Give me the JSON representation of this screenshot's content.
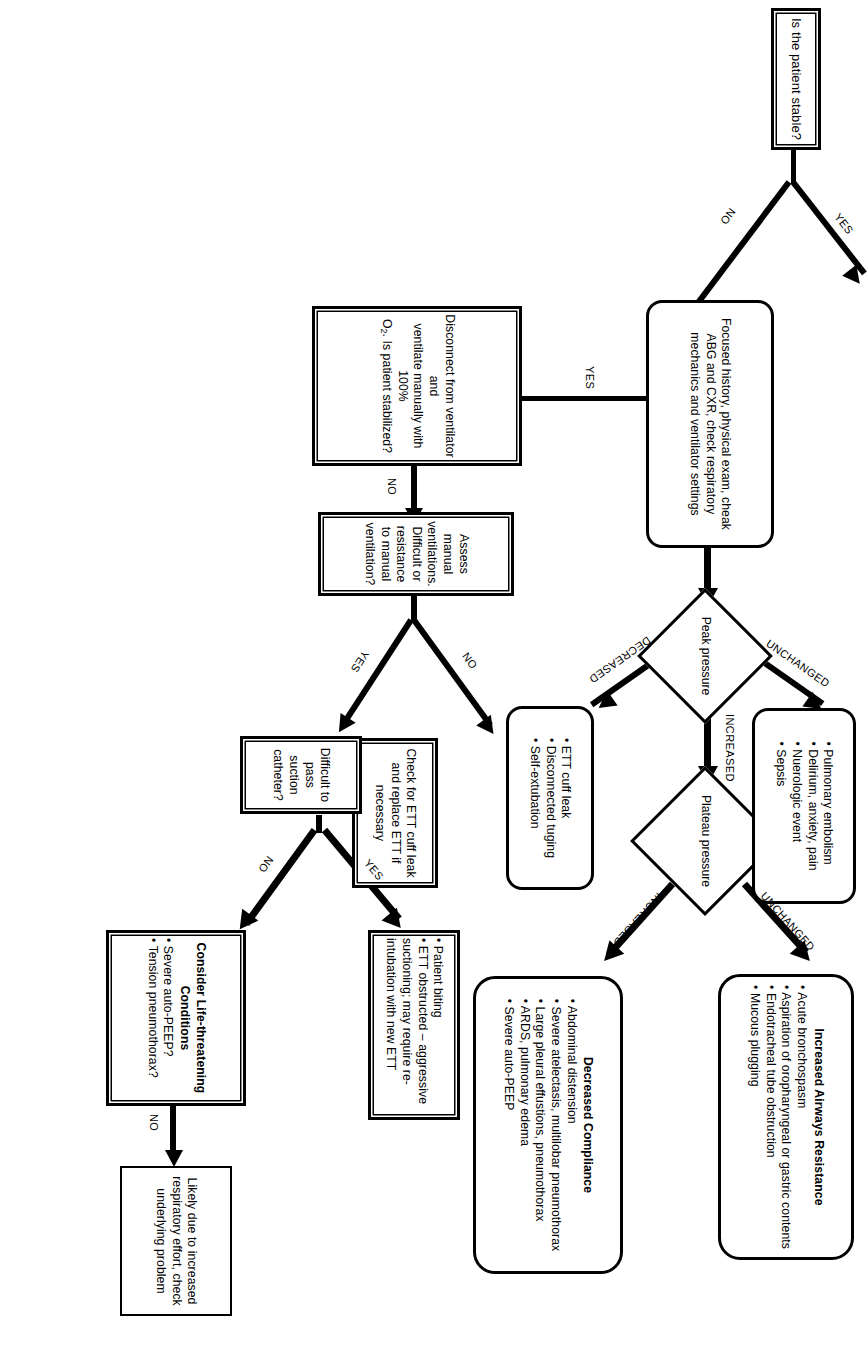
{
  "diagram": {
    "type": "flowchart",
    "orientation": "rotated-90-clockwise",
    "nodes": {
      "start": {
        "text": "Is the patient stable?"
      },
      "focused_history": {
        "text": "Focused history, physical exam, cheak ABG and CXR, check respiratory mechanics and ventilator settings"
      },
      "peak_pressure": {
        "text": "Peak pressure"
      },
      "plateau_pressure": {
        "text": "Plateau pressure"
      },
      "unchanged_list": {
        "items": [
          "Pulmonary embolism",
          "Delirium, anxiety, pain",
          "Nuerologic event",
          "Sepsis"
        ]
      },
      "decreased_list": {
        "items": [
          "ETT cuff leak",
          "Disconnected tuging",
          "Self-extubation"
        ]
      },
      "increased_airways_resistance": {
        "heading": "Increased Airways Resistance",
        "items": [
          "Acute bronchospasm",
          "Aspiration of oropharyngeal or gastric contents",
          "Endotracheal tube obstruction",
          "Mucous plugging"
        ]
      },
      "decreased_compliance": {
        "heading": "Decreased Compliance",
        "items": [
          "Abdominal distension",
          "Severe atelectasis, multilobar pneumothorax",
          "Large pleural effustions, pneumothorax",
          "ARDS, pulmonary edema",
          "Severe auto-PEEP"
        ]
      },
      "disconnect": {
        "line1": "Disconnect from ventilator and",
        "line2": "ventilate manually with 100%",
        "line3_pre": "O",
        "line3_sub": "2",
        "line3_post": ". Is patient stabilized?"
      },
      "assess_manual": {
        "text": "Assess manual ventilations. Difficult or resistance to manual ventilation?"
      },
      "check_ett_cuff": {
        "text": "Check for ETT cuff leak and replace ETT if necessary"
      },
      "difficult_suction": {
        "text": "Difficult to pass suction catheter?"
      },
      "patient_biting": {
        "items": [
          "Patient biting",
          "ETT obstructed – aggressive suctioning; may require re-intubation with new ETT"
        ]
      },
      "life_threatening": {
        "heading": "Consider Life-threatening Conditions",
        "items": [
          "Severe auto-PEEP?",
          "Tension pneumothorax?"
        ]
      },
      "likely_due": {
        "text": "Likely due to increased respiratory effort, check underlying problem"
      }
    },
    "edge_labels": {
      "stable_yes": "YES",
      "stable_no": "NO",
      "disconnect_yes": "YES",
      "disconnect_no": "NO",
      "peak_unchanged": "UNCHANGED",
      "peak_decreased": "DECREASED",
      "peak_increased": "INCREASED",
      "plateau_unchanged": "UNCHANGED",
      "plateau_increased": "INCREASED",
      "assess_no": "NO",
      "assess_yes": "YES",
      "suction_yes": "YES",
      "suction_no": "NO",
      "life_no": "NO"
    },
    "colors": {
      "stroke": "#000000",
      "fill": "#ffffff",
      "background": "#ffffff"
    }
  }
}
